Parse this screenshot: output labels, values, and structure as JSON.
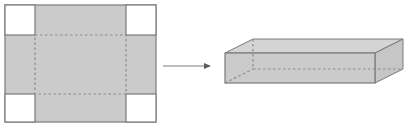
{
  "diagram": {
    "colors": {
      "fill": "#cbcbcb",
      "stroke": "#7a7a7a",
      "dashed": "#8a8a8a",
      "cutout": "#ffffff",
      "arrow": "#7a7a7a"
    },
    "net": {
      "outer": {
        "x": 5,
        "y": 5,
        "w": 151,
        "h": 117
      },
      "cut_size": 30,
      "label": "flat-net-with-corner-cutouts"
    },
    "arrow": {
      "x1": 163,
      "y1": 66,
      "x2": 211,
      "y2": 66,
      "label": "fold-arrow"
    },
    "box": {
      "label": "open-rectangular-box",
      "front": {
        "x": 225,
        "y": 53,
        "w": 150,
        "h": 30
      },
      "depth_dx": 28,
      "depth_dy": -14
    }
  }
}
